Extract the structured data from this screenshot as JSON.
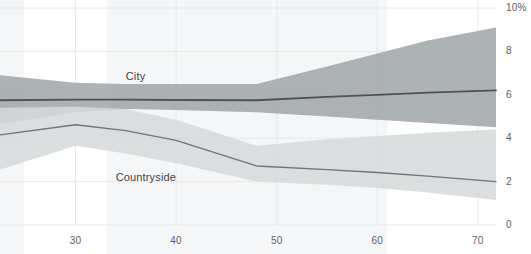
{
  "chart_data": {
    "type": "line",
    "title": "",
    "subtitle": "",
    "xlabel": "",
    "ylabel": "",
    "xlim": [
      22.5,
      71.8
    ],
    "ylim": [
      0,
      10
    ],
    "xticks": [
      30,
      40,
      50,
      60,
      70
    ],
    "xtick_labels": [
      "30",
      "40",
      "50",
      "60",
      "70"
    ],
    "yticks": [
      0,
      2,
      4,
      6,
      8,
      10
    ],
    "ytick_labels": [
      "0",
      "2",
      "4",
      "6",
      "8",
      "10%"
    ],
    "grid": true,
    "legend": "inline-labels",
    "band_meaning": "confidence interval",
    "series": [
      {
        "name": "City",
        "color": "#4d5256",
        "band_color": "#9fa4a8",
        "label_x": 35,
        "label_y": 6.8,
        "x": [
          22.5,
          30,
          35,
          40,
          48,
          55,
          60,
          65,
          71.8
        ],
        "values": [
          5.75,
          5.78,
          5.78,
          5.76,
          5.75,
          5.9,
          6.0,
          6.1,
          6.2
        ],
        "band_low": [
          4.65,
          5.2,
          5.35,
          5.3,
          5.2,
          5.0,
          4.85,
          4.7,
          4.5
        ],
        "band_high": [
          6.9,
          6.55,
          6.5,
          6.5,
          6.5,
          7.3,
          7.9,
          8.5,
          9.1
        ]
      },
      {
        "name": "Countryside",
        "color": "#6e7478",
        "band_color": "#d6d9db",
        "label_x": 34,
        "label_y": 2.15,
        "x": [
          22.5,
          30,
          35,
          40,
          48,
          55,
          60,
          65,
          71.8
        ],
        "values": [
          4.15,
          4.62,
          4.35,
          3.9,
          2.72,
          2.55,
          2.42,
          2.25,
          2.0
        ],
        "band_low": [
          2.55,
          3.65,
          3.3,
          2.85,
          2.0,
          1.85,
          1.7,
          1.5,
          1.15
        ],
        "band_high": [
          5.4,
          5.45,
          5.35,
          4.85,
          3.65,
          3.95,
          4.1,
          4.25,
          4.4
        ]
      }
    ],
    "background_bands": [
      {
        "x_start": 22.5,
        "x_end": 24.9
      },
      {
        "x_start": 33.1,
        "x_end": 61.0
      }
    ],
    "colors": {
      "grid": "#e6e8ea",
      "axis_text": "#5b6166",
      "label_text": "#3d4347",
      "city_line": "#4d5256",
      "city_band": "#9fa4a8",
      "countryside_line": "#6e7478",
      "countryside_band": "#d6d9db",
      "background_band": "#f5f6f7",
      "page_background": "#ffffff"
    }
  }
}
